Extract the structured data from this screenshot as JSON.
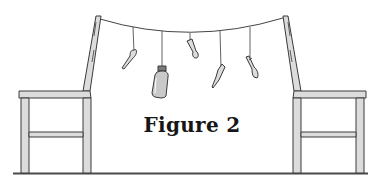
{
  "figure": {
    "caption": "Figure 2"
  },
  "colors": {
    "line": "#3a3a3a",
    "wood_fill": "#dcdcdc",
    "bottle_fill": "#c9c9c9",
    "background": "#ffffff",
    "caption": "#161616"
  },
  "scene": {
    "chairs": [
      {
        "id": "left-chair",
        "facing": "left"
      },
      {
        "id": "right-chair",
        "facing": "right"
      }
    ],
    "string": {
      "from": "left-chair-backrest",
      "to": "right-chair-backrest"
    },
    "hanging_items": [
      {
        "id": "item-1",
        "type": "spoon"
      },
      {
        "id": "item-2",
        "type": "bottle"
      },
      {
        "id": "item-3",
        "type": "spoon"
      },
      {
        "id": "item-4",
        "type": "knife"
      },
      {
        "id": "item-5",
        "type": "fork"
      }
    ]
  }
}
